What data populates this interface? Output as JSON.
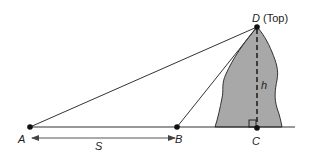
{
  "diagram": {
    "points": {
      "A": {
        "label": "A",
        "x": 30,
        "y": 127
      },
      "B": {
        "label": "B",
        "x": 177,
        "y": 127
      },
      "C": {
        "label": "C",
        "x": 257,
        "y": 128
      },
      "D": {
        "label": "D",
        "x": 257,
        "y": 27
      }
    },
    "labels": {
      "top": "(Top)",
      "height": "h",
      "distance": "S"
    },
    "colors": {
      "mountain_fill": "#a8a8a8",
      "line": "#222222"
    }
  }
}
